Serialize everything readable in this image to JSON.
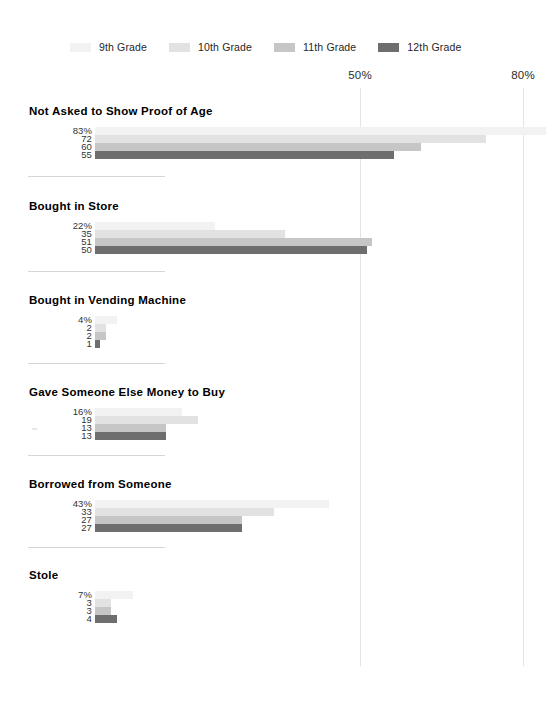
{
  "chart_data": {
    "type": "bar",
    "orientation": "horizontal",
    "title": "",
    "xlabel": "",
    "ylabel": "",
    "xlim": [
      0,
      100
    ],
    "grid": true,
    "gridlines": [
      {
        "value": 50,
        "label": "50%"
      },
      {
        "value": 80,
        "label": "80%"
      }
    ],
    "legend_position": "top",
    "series": [
      {
        "name": "9th Grade",
        "color": "#f2f2f2"
      },
      {
        "name": "10th Grade",
        "color": "#e2e2e2"
      },
      {
        "name": "11th Grade",
        "color": "#c6c6c6"
      },
      {
        "name": "12th Grade",
        "color": "#6e6e6e"
      }
    ],
    "categories": [
      "Not Asked to Show Proof of Age",
      "Bought in Store",
      "Bought in Vending Machine",
      "Gave Someone Else Money to Buy",
      "Borrowed from Someone",
      "Stole"
    ],
    "groups": [
      {
        "label": "Not Asked to Show Proof of Age",
        "values": [
          83,
          72,
          60,
          55
        ],
        "value_labels": [
          "83%",
          "72",
          "60",
          "55"
        ]
      },
      {
        "label": "Bought in Store",
        "values": [
          22,
          35,
          51,
          50
        ],
        "value_labels": [
          "22%",
          "35",
          "51",
          "50"
        ]
      },
      {
        "label": "Bought in Vending Machine",
        "values": [
          4,
          2,
          2,
          1
        ],
        "value_labels": [
          "4%",
          "2",
          "2",
          "1"
        ]
      },
      {
        "label": "Gave Someone Else Money to Buy",
        "values": [
          16,
          19,
          13,
          13
        ],
        "value_labels": [
          "16%",
          "19",
          "13",
          "13"
        ]
      },
      {
        "label": "Borrowed from Someone",
        "values": [
          43,
          33,
          27,
          27
        ],
        "value_labels": [
          "43%",
          "33",
          "27",
          "27"
        ]
      },
      {
        "label": "Stole",
        "values": [
          7,
          3,
          3,
          4
        ],
        "value_labels": [
          "7%",
          "3",
          "3",
          "4"
        ]
      }
    ]
  },
  "legend": {
    "items": [
      {
        "label": "9th Grade",
        "color": "#f2f2f2"
      },
      {
        "label": "10th Grade",
        "color": "#e2e2e2"
      },
      {
        "label": "11th Grade",
        "color": "#c6c6c6"
      },
      {
        "label": "12th Grade",
        "color": "#6e6e6e"
      }
    ]
  }
}
